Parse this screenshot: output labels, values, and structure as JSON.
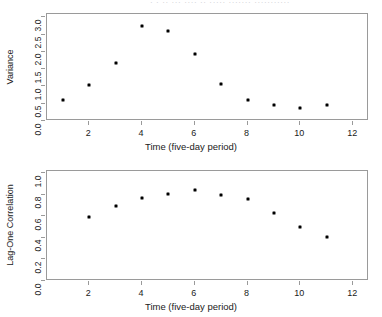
{
  "page": {
    "header_remnant": "· · ·· ··· ···· ·· ····· ······· ···········",
    "background": "#ffffff",
    "point_color": "#000000",
    "frame_color": "#9a9a9a"
  },
  "chart_data": [
    {
      "type": "scatter",
      "title": "",
      "xlabel": "Time (five-day period)",
      "ylabel": "Variance",
      "xlim": [
        0.4,
        12.6
      ],
      "ylim": [
        0.0,
        3.1
      ],
      "xticks": [
        2,
        4,
        6,
        8,
        10,
        12
      ],
      "xtick_labels": [
        "2",
        "4",
        "6",
        "8",
        "10",
        "12"
      ],
      "yticks": [
        0.0,
        0.5,
        1.0,
        1.5,
        2.0,
        2.5,
        3.0
      ],
      "ytick_labels": [
        "0.0",
        "0.5",
        "1.0",
        "1.5",
        "2.0",
        "2.5",
        "3.0"
      ],
      "grid": false,
      "legend": false,
      "x": [
        1,
        2,
        3,
        4,
        5,
        6,
        7,
        8,
        9,
        10,
        11
      ],
      "values": [
        0.62,
        1.03,
        1.69,
        2.76,
        2.62,
        1.94,
        1.06,
        0.61,
        0.45,
        0.38,
        0.45
      ]
    },
    {
      "type": "scatter",
      "title": "",
      "xlabel": "Time (five-day period)",
      "ylabel": "Lag-One Correlation",
      "xlim": [
        0.4,
        12.6
      ],
      "ylim": [
        0.0,
        1.02
      ],
      "xticks": [
        2,
        4,
        6,
        8,
        10,
        12
      ],
      "xtick_labels": [
        "2",
        "4",
        "6",
        "8",
        "10",
        "12"
      ],
      "yticks": [
        0.0,
        0.2,
        0.4,
        0.6,
        0.8,
        1.0
      ],
      "ytick_labels": [
        "0.0",
        "0.2",
        "0.4",
        "0.6",
        "0.8",
        "1.0"
      ],
      "grid": false,
      "legend": false,
      "x": [
        2,
        3,
        4,
        5,
        6,
        7,
        8,
        9,
        10,
        11
      ],
      "values": [
        0.59,
        0.7,
        0.77,
        0.81,
        0.84,
        0.8,
        0.76,
        0.63,
        0.5,
        0.41
      ]
    }
  ]
}
